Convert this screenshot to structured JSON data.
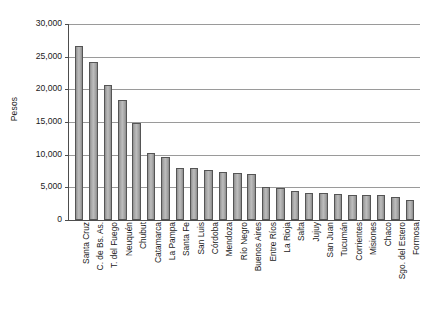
{
  "chart_data": {
    "type": "bar",
    "title": "",
    "xlabel": "",
    "ylabel": "Pesos",
    "ylim": [
      0,
      30000
    ],
    "ytick_labels": [
      "30,000",
      "25,000",
      "20,000",
      "15,000",
      "10,000",
      "5,000",
      "0"
    ],
    "ytick_values": [
      30000,
      25000,
      20000,
      15000,
      10000,
      5000,
      0
    ],
    "grid": true,
    "legend": "none",
    "orientation": "vertical",
    "bar_color": "#b0b0b0",
    "bar_border_color": "#555555",
    "categories": [
      "Santa Cruz",
      "C. de Bs. As.",
      "T. del Fuego",
      "Neuquén",
      "Chubut",
      "Catamarca",
      "La Pampa",
      "Santa Fe",
      "San Luis",
      "Córdoba",
      "Mendoza",
      "Río Negro",
      "Buenos Aires",
      "Entre Ríos",
      "La Rioja",
      "Salta",
      "Jujuy",
      "San Juan",
      "Tucumán",
      "Corrientes",
      "Misiones",
      "Chaco",
      "Sgo. del Estero",
      "Formosa"
    ],
    "values": [
      26700,
      24200,
      20600,
      18300,
      14800,
      10200,
      9700,
      8000,
      7900,
      7700,
      7400,
      7200,
      7100,
      5100,
      4900,
      4500,
      4200,
      4100,
      4000,
      3900,
      3900,
      3800,
      3500,
      3100
    ]
  }
}
